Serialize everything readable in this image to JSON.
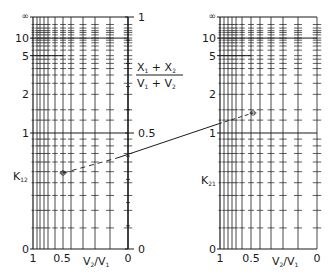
{
  "colors": {
    "ink": "#1a1a1a",
    "background": "#ffffff"
  },
  "k_scale": {
    "y_zero": 249,
    "y_inf": 17,
    "label_values": [
      {
        "value": "inf",
        "text": "∞"
      },
      {
        "value": 10,
        "text": "10"
      },
      {
        "value": 5,
        "text": "5"
      },
      {
        "value": 2,
        "text": "2"
      },
      {
        "value": 1,
        "text": "1"
      },
      {
        "value": 0,
        "text": "0"
      }
    ],
    "full_lines": [
      "inf",
      10,
      1,
      0
    ],
    "half_lines": [
      5
    ],
    "tick_values": [
      0.1,
      0.2,
      0.3,
      0.4,
      0.5,
      0.6,
      0.7,
      0.8,
      0.9,
      1.25,
      1.5,
      2,
      2.5,
      3,
      3.5,
      4,
      4.5,
      5,
      6,
      7,
      8,
      9,
      10,
      12,
      14,
      16,
      20,
      30
    ]
  },
  "left_panel": {
    "x_left": 33,
    "x_right": 128,
    "vertical_lines_x": [
      33,
      37,
      40,
      44,
      48,
      55,
      63,
      71,
      83,
      95,
      110,
      128
    ],
    "y_axis_label": {
      "text": "K",
      "subscript": "12",
      "x": 13,
      "y": 180
    },
    "x_tick_labels": [
      {
        "text": "1",
        "x": 33
      },
      {
        "text": "0.5",
        "x": 62
      },
      {
        "text": "0",
        "x": 128
      }
    ],
    "x_axis_label": {
      "text": "V",
      "sub1": "2",
      "mid": "/V",
      "sub2": "1",
      "x": 83
    }
  },
  "middle_axis": {
    "x": 128,
    "title": {
      "numerator": [
        "X",
        "1",
        " + X",
        "2"
      ],
      "denominator": [
        "V",
        "1",
        " + V",
        "2"
      ]
    },
    "labels": [
      {
        "value": 1,
        "text": "1"
      },
      {
        "value": 0.5,
        "text": "0.5"
      },
      {
        "value": 0,
        "text": "0"
      }
    ],
    "minor_ticks": [
      0.1,
      0.2,
      0.3,
      0.4,
      0.6,
      0.7,
      0.8,
      0.9
    ]
  },
  "right_panel": {
    "x_left": 220,
    "x_right": 317,
    "vertical_lines_x": [
      220,
      224,
      228,
      232,
      236,
      242,
      251,
      260,
      271,
      283,
      298,
      317
    ],
    "y_axis_label": {
      "text": "K",
      "subscript": "21",
      "x": 201,
      "y": 184
    },
    "x_tick_labels": [
      {
        "text": "1",
        "x": 220
      },
      {
        "text": "0.5",
        "x": 251
      },
      {
        "text": "0",
        "x": 317
      }
    ],
    "x_axis_label": {
      "text": "V",
      "sub1": "2",
      "mid": "/V",
      "sub2": "1",
      "x": 272
    }
  },
  "example_construction": {
    "point_left": {
      "x": 63,
      "y": 173
    },
    "dash_end_left": {
      "x": 117,
      "y": 158
    },
    "solid_end_right": {
      "x": 218,
      "y": 124
    },
    "point_right": {
      "x": 253,
      "y": 113
    }
  }
}
